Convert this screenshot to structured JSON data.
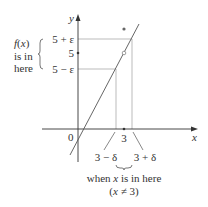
{
  "diagram": {
    "type": "epsilon-delta limit definition",
    "axes": {
      "x_label": "x",
      "y_label": "y",
      "origin_label": "0"
    },
    "y_ticks": {
      "upper": "5 + ε",
      "middle": "5",
      "lower": "5 − ε"
    },
    "x_ticks": {
      "center": "3",
      "left": "3 − δ",
      "right": "3 + δ"
    },
    "left_annotation": [
      "f(x)",
      "is in",
      "here"
    ],
    "bottom_annotation": {
      "line1": "when x is in here",
      "line2": "(x ≠ 3)"
    },
    "colors": {
      "axis": "#333333",
      "guides": "#aaaaaa",
      "curve": "#555555",
      "text": "#333333"
    }
  }
}
